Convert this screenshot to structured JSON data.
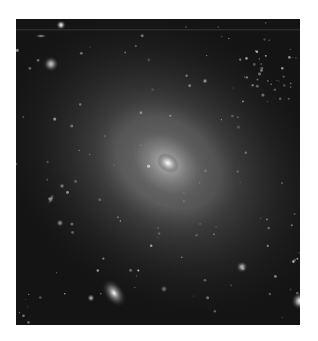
{
  "image": {
    "subject": "elliptical galaxy",
    "description": "Grayscale deep-field astronomical photograph of a large elliptical galaxy with a bright central core and diffuse halo, surrounded by faint background galaxies and stars",
    "colors": {
      "page_background": "#ffffff",
      "sky": "#141414",
      "halo": "#6e6e6e",
      "core": "#f2f2f2"
    },
    "objects": [
      {
        "name": "central-galaxy",
        "type": "elliptical galaxy",
        "brightness": 1.0
      },
      {
        "name": "companion-galaxy-lower-left",
        "type": "elliptical galaxy",
        "brightness": 0.7
      },
      {
        "name": "bright-star-top-left",
        "type": "star",
        "brightness": 0.8
      },
      {
        "name": "galaxy-upper-left",
        "type": "galaxy",
        "brightness": 0.6
      },
      {
        "name": "bright-star-right-edge",
        "type": "star",
        "brightness": 0.9
      },
      {
        "name": "galaxy-lower-right",
        "type": "galaxy",
        "brightness": 0.55
      },
      {
        "name": "star-lower-left",
        "type": "star",
        "brightness": 0.6
      }
    ]
  }
}
